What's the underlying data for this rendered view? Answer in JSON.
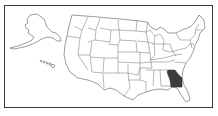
{
  "map": {
    "type": "us-state-locator",
    "highlighted_state": "Georgia",
    "colors": {
      "highlight": "#3c3c3c",
      "state_fill": "#ffffff",
      "state_border": "#6e6e6e",
      "frame_border": "#3a3a3a",
      "background": "#ffffff"
    },
    "insets": [
      "Alaska",
      "Hawaii"
    ]
  }
}
